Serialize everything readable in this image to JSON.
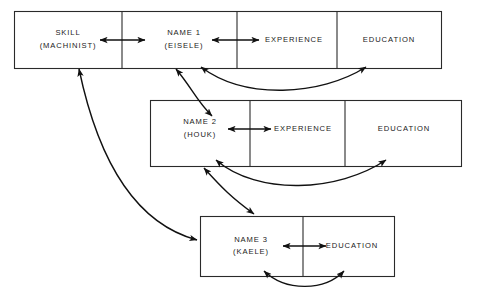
{
  "diagram": {
    "colors": {
      "box_stroke": "#2a2a2a",
      "arrow": "#111111",
      "background": "#ffffff",
      "text": "#1a1a1a"
    },
    "records": [
      {
        "id": "record-1",
        "cells": [
          {
            "id": "skill",
            "line1": "SKILL",
            "line2": "(MACHINIST)"
          },
          {
            "id": "name-1",
            "line1": "NAME 1",
            "line2": "(EISELE)"
          },
          {
            "id": "experience-1",
            "line1": "EXPERIENCE",
            "line2": ""
          },
          {
            "id": "education-1",
            "line1": "EDUCATION",
            "line2": ""
          }
        ]
      },
      {
        "id": "record-2",
        "cells": [
          {
            "id": "name-2",
            "line1": "NAME 2",
            "line2": "(HOUK)"
          },
          {
            "id": "experience-2",
            "line1": "EXPERIENCE",
            "line2": ""
          },
          {
            "id": "education-2",
            "line1": "EDUCATION",
            "line2": ""
          }
        ]
      },
      {
        "id": "record-3",
        "cells": [
          {
            "id": "name-3",
            "line1": "NAME 3",
            "line2": "(KAELE)"
          },
          {
            "id": "education-3",
            "line1": "EDUCATION",
            "line2": ""
          }
        ]
      }
    ],
    "connectors": [
      {
        "id": "skill-to-name1",
        "kind": "straight-double",
        "from": "skill",
        "to": "name-1"
      },
      {
        "id": "name1-to-experience1",
        "kind": "straight-double",
        "from": "name-1",
        "to": "experience-1"
      },
      {
        "id": "name2-to-experience2",
        "kind": "straight-double",
        "from": "name-2",
        "to": "experience-2"
      },
      {
        "id": "name3-to-education3",
        "kind": "straight-double",
        "from": "name-3",
        "to": "education-3"
      },
      {
        "id": "name1-to-education1",
        "kind": "curved-double",
        "from": "name-1",
        "to": "education-1"
      },
      {
        "id": "name2-to-education2",
        "kind": "curved-double",
        "from": "name-2",
        "to": "education-2"
      },
      {
        "id": "name3-to-education3-curve",
        "kind": "curved-double",
        "from": "name-3",
        "to": "education-3"
      },
      {
        "id": "record1-to-record2",
        "kind": "curved-double",
        "from": "record-1",
        "to": "record-2"
      },
      {
        "id": "record2-to-record3",
        "kind": "curved-double",
        "from": "record-2",
        "to": "record-3"
      },
      {
        "id": "skill-to-name3",
        "kind": "curved-double",
        "from": "skill",
        "to": "name-3"
      }
    ]
  }
}
